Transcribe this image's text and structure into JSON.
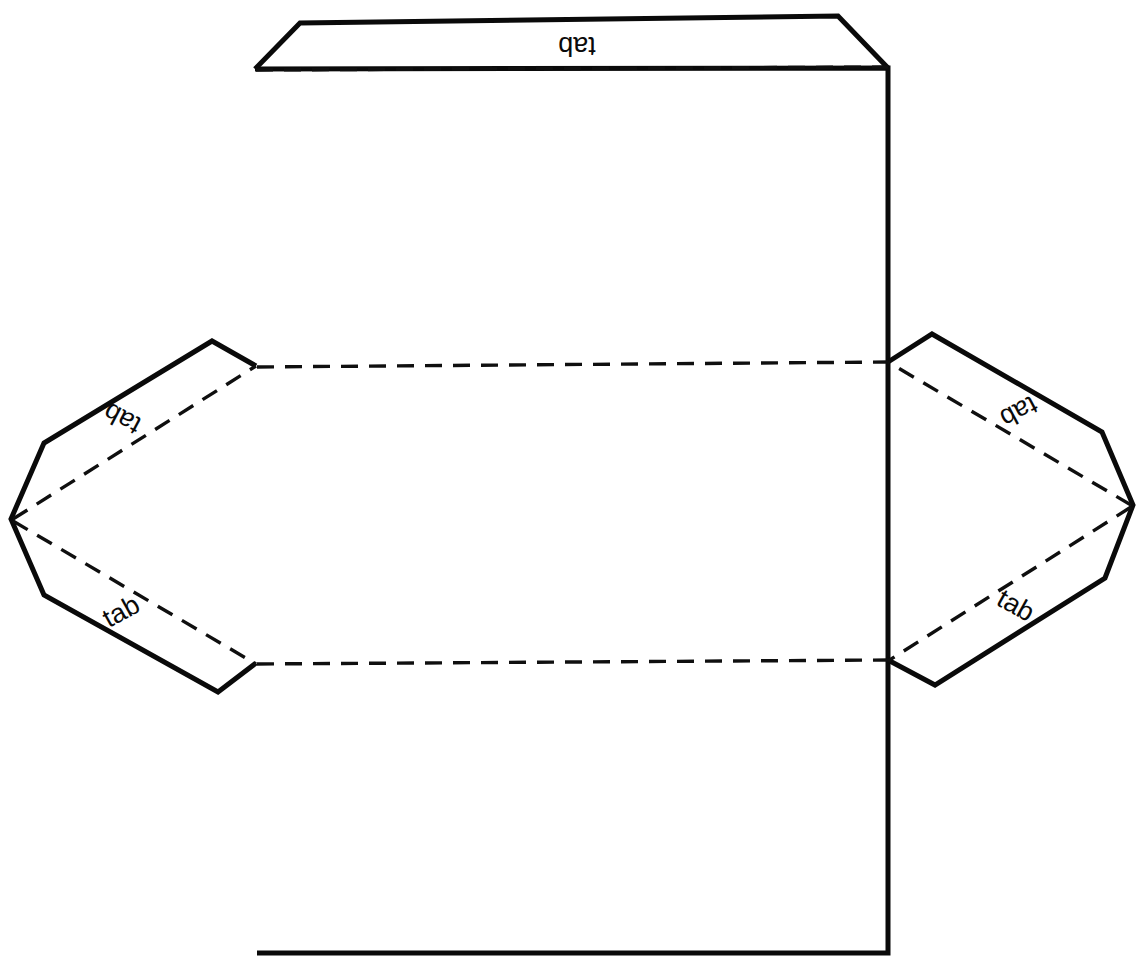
{
  "diagram": {
    "background_color": "#ffffff",
    "line_color": "#0a0a0a",
    "canvas": {
      "width": 1144,
      "height": 959
    },
    "labels": [
      {
        "id": "top-tab-label",
        "text": "tab",
        "x": 577,
        "y": 44,
        "rotation": 180
      },
      {
        "id": "left-upper-tab-label",
        "text": "tab",
        "x": 123,
        "y": 417,
        "rotation": 208
      },
      {
        "id": "left-lower-tab-label",
        "text": "tab",
        "x": 122,
        "y": 613,
        "rotation": -29
      },
      {
        "id": "right-upper-tab-label",
        "text": "tab",
        "x": 1018,
        "y": 410,
        "rotation": 152
      },
      {
        "id": "right-lower-tab-label",
        "text": "tab",
        "x": 1015,
        "y": 607,
        "rotation": 29
      }
    ],
    "shapes": {
      "main_panel": {
        "name": "main-body-panel",
        "points": "255,69 888,68 888,953 257,953"
      },
      "top_flap": {
        "name": "top-flap",
        "points": "255,69 300,23 838,16 888,68"
      },
      "left_tab": {
        "name": "left-tab-group",
        "points": "256,366 212,341 44,443 11,519 44,595 218,692 256,663"
      },
      "right_tab": {
        "name": "right-tab-group",
        "points": "888,362 932,334 1102,432 1133,505 1105,578 935,685 888,660"
      }
    },
    "fold_lines": {
      "top_fold": {
        "name": "top-fold-line",
        "d": "M 256,70 L 888,67"
      },
      "middle_fold": {
        "name": "middle-horizontal-fold",
        "d": "M 257,367 L 888,362"
      },
      "lower_fold": {
        "name": "lower-horizontal-fold",
        "d": "M 257,664 L 888,660"
      },
      "left_upper": {
        "name": "left-upper-diagonal-fold",
        "d": "M 13,519 L 256,366"
      },
      "left_lower": {
        "name": "left-lower-diagonal-fold",
        "d": "M 13,521 L 256,664"
      },
      "right_upper": {
        "name": "right-upper-diagonal-fold",
        "d": "M 1131,505 L 888,362"
      },
      "right_lower": {
        "name": "right-lower-diagonal-fold",
        "d": "M 1131,507 L 888,661"
      }
    }
  }
}
